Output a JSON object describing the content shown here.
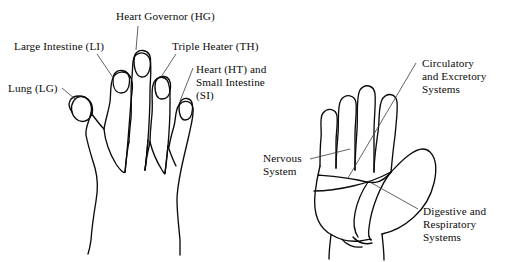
{
  "figure": {
    "kind": "anatomical-correspondence-diagram",
    "background_color": "#ffffff",
    "ink_color": "#0b0b0b",
    "width": 510,
    "height": 262
  },
  "left_hand": {
    "name": "left-hand-dorsal-view",
    "description": "Back of hand with five fingers and fingernails",
    "labels": [
      {
        "id": "lung",
        "text": "Lung (LG)",
        "x": 8,
        "y": 82,
        "lines": 1
      },
      {
        "id": "large-intestine",
        "text": "Large Intestine (LI)",
        "x": 14,
        "y": 40,
        "lines": 1
      },
      {
        "id": "heart-governor",
        "text": "Heart Governor (HG)",
        "x": 116,
        "y": 10,
        "lines": 1
      },
      {
        "id": "triple-heater",
        "text": "Triple Heater (TH)",
        "x": 172,
        "y": 40,
        "lines": 1
      },
      {
        "id": "heart-small-intestine",
        "text": "Heart (HT) and\nSmall Intestine\n(SI)",
        "x": 196,
        "y": 63,
        "lines": 3
      }
    ]
  },
  "right_hand": {
    "name": "right-hand-palmar-view",
    "description": "Palm of hand with five fingers and palm creases",
    "labels": [
      {
        "id": "circulatory-excretory",
        "text": "Circulatory\nand Excretory\nSystems",
        "x": 422,
        "y": 57,
        "lines": 3
      },
      {
        "id": "nervous",
        "text": "Nervous\nSystem",
        "x": 263,
        "y": 152,
        "lines": 2
      },
      {
        "id": "digestive-respiratory",
        "text": "Digestive and\nRespiratory\nSystems",
        "x": 423,
        "y": 205,
        "lines": 3
      }
    ]
  }
}
